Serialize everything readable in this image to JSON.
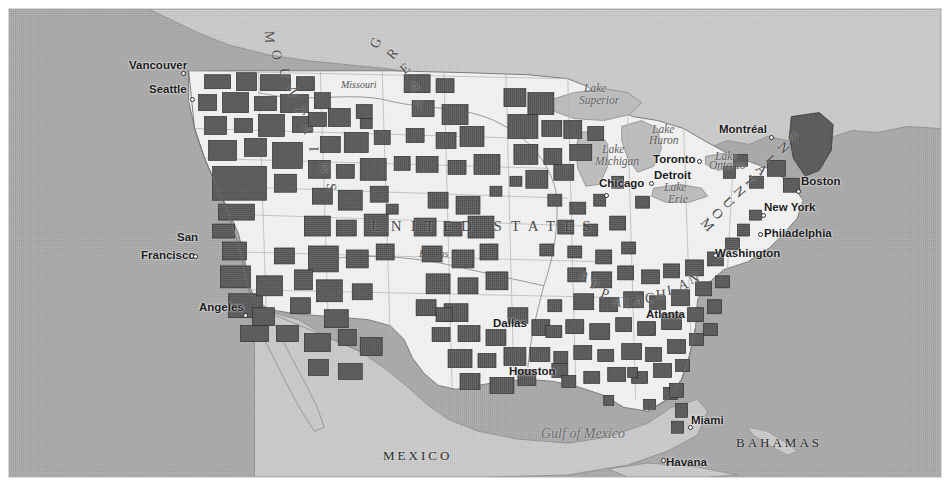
{
  "figure": {
    "kind": "thematic-choropleth-map",
    "title": "",
    "extent": "North America — contiguous United States",
    "background_hex": "#ffffff",
    "border_hex": "#d8d8d8"
  },
  "map": {
    "colors": {
      "ocean_hex": "#a9a9a9",
      "land_us_hex": "#f2f2f2",
      "land_foreign_hex": "#c8c8c8",
      "shaded_region_hex": "#5a5a5a",
      "shaded_region_outline_hex": "#2e2e2e",
      "state_border_hex": "#9a9a9a",
      "coastline_hex": "#6f6f6f",
      "river_hex": "#8a8a8a",
      "lake_hex": "#b9b9b9"
    },
    "city_labels": [
      {
        "name": "Vancouver",
        "x": 128,
        "y": 58,
        "dot_x": 180,
        "dot_y": 70
      },
      {
        "name": "Seattle",
        "x": 148,
        "y": 82,
        "dot_x": 189,
        "dot_y": 96
      },
      {
        "name": "San",
        "x": 176,
        "y": 230,
        "dot_x": null,
        "dot_y": null
      },
      {
        "name": "Francisco",
        "x": 140,
        "y": 248,
        "dot_x": 192,
        "dot_y": 253
      },
      {
        "name": "Angeles",
        "x": 198,
        "y": 300,
        "dot_x": 242,
        "dot_y": 312
      },
      {
        "name": "Dallas",
        "x": 492,
        "y": 316,
        "dot_x": null,
        "dot_y": null
      },
      {
        "name": "Houston",
        "x": 508,
        "y": 364,
        "dot_x": null,
        "dot_y": null
      },
      {
        "name": "Chicago",
        "x": 598,
        "y": 176,
        "dot_x": 603,
        "dot_y": 192
      },
      {
        "name": "Detroit",
        "x": 653,
        "y": 168,
        "dot_x": 648,
        "dot_y": 180
      },
      {
        "name": "Toronto",
        "x": 652,
        "y": 152,
        "dot_x": 696,
        "dot_y": 158
      },
      {
        "name": "Montréal",
        "x": 718,
        "y": 122,
        "dot_x": 768,
        "dot_y": 134
      },
      {
        "name": "Boston",
        "x": 800,
        "y": 174,
        "dot_x": 795,
        "dot_y": 188
      },
      {
        "name": "New York",
        "x": 763,
        "y": 200,
        "dot_x": 760,
        "dot_y": 212
      },
      {
        "name": "Philadelphia",
        "x": 763,
        "y": 226,
        "dot_x": 757,
        "dot_y": 231
      },
      {
        "name": "Washington",
        "x": 714,
        "y": 246,
        "dot_x": 712,
        "dot_y": 252
      },
      {
        "name": "Atlanta",
        "x": 645,
        "y": 307,
        "dot_x": null,
        "dot_y": null
      },
      {
        "name": "Miami",
        "x": 690,
        "y": 413,
        "dot_x": 687,
        "dot_y": 424
      },
      {
        "name": "Havana",
        "x": 665,
        "y": 455,
        "dot_x": 660,
        "dot_y": 457
      }
    ],
    "water_labels": [
      {
        "name": "Lake",
        "x": 583,
        "y": 81,
        "size": "normal"
      },
      {
        "name": "Superior",
        "x": 578,
        "y": 93,
        "size": "normal"
      },
      {
        "name": "Lake",
        "x": 651,
        "y": 122,
        "size": "normal"
      },
      {
        "name": "Huron",
        "x": 648,
        "y": 133,
        "size": "normal"
      },
      {
        "name": "Lake",
        "x": 601,
        "y": 142,
        "size": "normal"
      },
      {
        "name": "Michigan",
        "x": 594,
        "y": 154,
        "size": "normal"
      },
      {
        "name": "Lake",
        "x": 714,
        "y": 149,
        "size": "normal"
      },
      {
        "name": "Ontario",
        "x": 708,
        "y": 158,
        "size": "normal"
      },
      {
        "name": "Lake",
        "x": 663,
        "y": 180,
        "size": "normal"
      },
      {
        "name": "Erie",
        "x": 667,
        "y": 192,
        "size": "normal"
      },
      {
        "name": "Gulf of Mexico",
        "x": 540,
        "y": 425,
        "size": "big"
      }
    ],
    "country_labels": [
      {
        "name": "MEXICO",
        "x": 382,
        "y": 447,
        "style": "country-label"
      },
      {
        "name": "BAHAMAS",
        "x": 735,
        "y": 434,
        "style": "country-label"
      },
      {
        "name": "CUBA",
        "x": 710,
        "y": 478,
        "style": "country-label"
      }
    ],
    "united_states_label": {
      "text": "UNITED STATES",
      "x": 370,
      "y": 217
    },
    "river_labels": [
      {
        "name": "Missouri",
        "x": 340,
        "y": 78
      },
      {
        "name": "Kansas",
        "x": 418,
        "y": 247
      }
    ],
    "arc_labels": [
      {
        "name": "GREAT PLAINS",
        "chars": [
          "G",
          "R",
          "E",
          "A",
          "T"
        ],
        "positions": [
          [
            370,
            34
          ],
          [
            387,
            45
          ],
          [
            400,
            60
          ],
          [
            409,
            78
          ],
          [
            414,
            97
          ]
        ]
      },
      {
        "name": "ROCKY MOUNTAINS",
        "chars": [
          "M",
          "O",
          "U",
          "N",
          "T",
          "A",
          "I",
          "N",
          "S"
        ],
        "positions": [
          [
            262,
            28
          ],
          [
            270,
            46
          ],
          [
            278,
            64
          ],
          [
            286,
            83
          ],
          [
            294,
            102
          ],
          [
            302,
            121
          ],
          [
            310,
            140
          ],
          [
            318,
            159
          ],
          [
            326,
            178
          ]
        ]
      },
      {
        "name": "APPALACHIAN MOUNTAINS",
        "chars": [
          "M",
          "O",
          "U",
          "N",
          "T",
          "A",
          "I",
          "N",
          "S"
        ],
        "positions": [
          [
            700,
            216
          ],
          [
            711,
            205
          ],
          [
            722,
            194
          ],
          [
            733,
            183
          ],
          [
            744,
            172
          ],
          [
            755,
            161
          ],
          [
            766,
            150
          ],
          [
            777,
            139
          ],
          [
            788,
            128
          ]
        ]
      },
      {
        "name": "APPALACHIAN",
        "chars": [
          "A",
          "P",
          "P",
          "A",
          "L",
          "A",
          "C",
          "H",
          "I",
          "A",
          "N"
        ],
        "positions": [
          [
            578,
            268
          ],
          [
            589,
            276
          ],
          [
            600,
            285
          ],
          [
            611,
            293
          ],
          [
            622,
            295
          ],
          [
            633,
            293
          ],
          [
            644,
            290
          ],
          [
            655,
            286
          ],
          [
            666,
            282
          ],
          [
            677,
            276
          ],
          [
            688,
            270
          ]
        ]
      }
    ]
  },
  "legend": {
    "present": false,
    "description": "No legend rendered in image; dark polygons denote highlighted counties/regions."
  },
  "chart_data": {
    "type": "map",
    "variable": "highlighted region (binary shading)",
    "shaded_color": "#5a5a5a",
    "unshaded_color": "#f2f2f2"
  }
}
